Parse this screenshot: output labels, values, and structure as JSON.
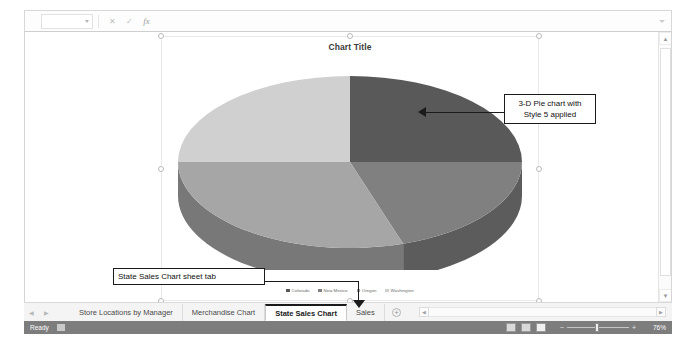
{
  "formula_bar": {
    "name_box_value": "",
    "cancel_icon": "cancel-icon",
    "enter_icon": "enter-icon",
    "function_icon": "fx",
    "input_value": "",
    "expand_icon": "chevron-down-icon"
  },
  "chart": {
    "title": "Chart Title",
    "selected": true,
    "style_note": "Style 5"
  },
  "annotations": [
    {
      "id": "pie-callout",
      "text": "3-D Pie chart with Style 5 applied"
    },
    {
      "id": "tab-callout",
      "text": "State Sales Chart sheet tab"
    }
  ],
  "chart_data": {
    "type": "pie",
    "title": "Chart Title",
    "subtitle": "",
    "xlabel": "",
    "ylabel": "",
    "three_d": true,
    "style": "Style 5",
    "legend_position": "bottom",
    "grid": false,
    "categories": [
      "Colorado",
      "New Mexico",
      "Oregon",
      "Washington"
    ],
    "values": [
      25,
      20,
      30,
      25
    ],
    "colors": [
      "#595959",
      "#808080",
      "#a6a6a6",
      "#d0d0d0"
    ],
    "slices": [
      {
        "label": "Colorado",
        "value": 25,
        "color": "#595959"
      },
      {
        "label": "New Mexico",
        "value": 20,
        "color": "#808080"
      },
      {
        "label": "Oregon",
        "value": 30,
        "color": "#a6a6a6"
      },
      {
        "label": "Washington",
        "value": 25,
        "color": "#d0d0d0"
      }
    ]
  },
  "sheet_tabs": {
    "first_icon": "first-sheet-icon",
    "prev_icon": "previous-sheet-icon",
    "items": [
      {
        "label": "Store Locations by Manager",
        "active": false
      },
      {
        "label": "Merchandise Chart",
        "active": false
      },
      {
        "label": "State Sales Chart",
        "active": true
      },
      {
        "label": "Sales",
        "active": false
      }
    ],
    "add_label": "+"
  },
  "status_bar": {
    "ready_text": "Ready",
    "accessibility_icon": "accessibility-icon",
    "views": [
      {
        "name": "normal-view",
        "active": false
      },
      {
        "name": "page-layout-view",
        "active": false
      },
      {
        "name": "page-break-preview",
        "active": true
      }
    ],
    "zoom_out": "−",
    "zoom_in": "+",
    "zoom_level": "76%"
  }
}
